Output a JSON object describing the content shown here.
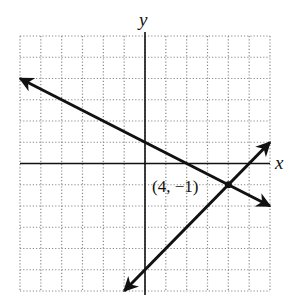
{
  "chart_data": {
    "type": "line",
    "title": "",
    "xlabel": "x",
    "ylabel": "y",
    "xlim": [
      -6,
      6
    ],
    "ylim": [
      -6,
      6
    ],
    "grid": true,
    "grid_style": "dotted",
    "grid_step": 1,
    "series": [
      {
        "name": "line-1",
        "equation": "y = -0.5x + 1",
        "slope": -0.5,
        "intercept": 1,
        "x": [
          -6,
          6
        ],
        "y": [
          4,
          -2
        ],
        "arrows": "both"
      },
      {
        "name": "line-2",
        "equation": "y = x - 5",
        "slope": 1,
        "intercept": -5,
        "x": [
          -1,
          6
        ],
        "y": [
          -6,
          1
        ],
        "arrows": "both"
      }
    ],
    "annotations": [
      {
        "text": "(4, −1)",
        "x": 4,
        "y": -1,
        "type": "intersection-point"
      }
    ]
  },
  "labels": {
    "x_axis": "x",
    "y_axis": "y",
    "intersection": "(4, −1)"
  },
  "colors": {
    "line": "#111111",
    "grid": "#888888",
    "axis": "#111111"
  }
}
